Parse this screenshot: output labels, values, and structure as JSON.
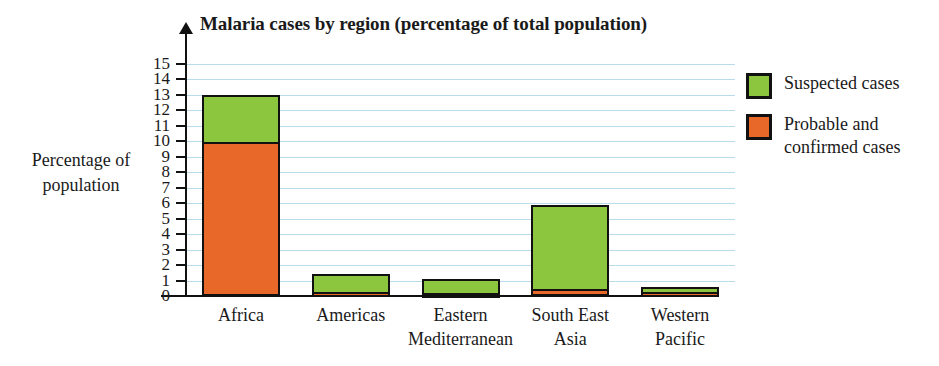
{
  "chart_data": {
    "type": "bar",
    "title": "Malaria cases by region (percentage of total population)",
    "subtitle": "",
    "xlabel": "",
    "ylabel": "Percentage of population",
    "ylim": [
      0,
      15
    ],
    "ytick_step": 1,
    "grid": true,
    "stacked": true,
    "legend_position": "right",
    "categories": [
      "Africa",
      "Americas",
      "Eastern Mediterranean",
      "South East Asia",
      "Western Pacific"
    ],
    "series": [
      {
        "name": "Probable and confirmed cases",
        "color": "#E8682A",
        "values": [
          9.8,
          0.12,
          0.08,
          0.35,
          0.1
        ]
      },
      {
        "name": "Suspected cases",
        "color": "#8CC63E",
        "values": [
          3.2,
          1.28,
          1.02,
          5.55,
          0.5
        ]
      }
    ],
    "totals": [
      13.0,
      1.4,
      1.1,
      5.9,
      0.6
    ],
    "ytick_labels": [
      "0",
      "1",
      "2",
      "3",
      "4",
      "5",
      "6",
      "7",
      "8",
      "9",
      "10",
      "11",
      "12",
      "13",
      "14",
      "15"
    ]
  },
  "axis": {
    "y_title_line1": "Percentage of",
    "y_title_line2": "population"
  },
  "categories_display": [
    {
      "line1": "Africa",
      "line2": ""
    },
    {
      "line1": "Americas",
      "line2": ""
    },
    {
      "line1": "Eastern",
      "line2": "Mediterranean"
    },
    {
      "line1": "South East",
      "line2": "Asia"
    },
    {
      "line1": "Western",
      "line2": "Pacific"
    }
  ],
  "legend": {
    "items": [
      {
        "label": "Suspected cases",
        "color": "#8CC63E"
      },
      {
        "label": "Probable and\nconfirmed cases",
        "color": "#E8682A",
        "line1": "Probable and",
        "line2": "confirmed cases"
      }
    ]
  },
  "colors": {
    "suspected": "#8CC63E",
    "probable_confirmed": "#E8682A",
    "gridline": "#B9DCEA",
    "axis": "#111111",
    "background": "#FFFFFF"
  }
}
